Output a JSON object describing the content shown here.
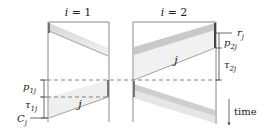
{
  "machines": [
    {
      "label": "i = 1"
    },
    {
      "label": "i = 2"
    }
  ],
  "job_labels": {
    "job_machine1": "j",
    "job_machine2": "j"
  },
  "annotations": {
    "r": "r",
    "r_sub": "j",
    "p2": "p",
    "p2_sub": "2j",
    "tau2": "τ",
    "tau2_sub": "2j",
    "p1": "p",
    "p1_sub": "1j",
    "tau1": "τ",
    "tau1_sub": "1j",
    "C": "C",
    "C_sub": "j",
    "time": "time"
  },
  "colors": {
    "frame": "#8a8a8a",
    "band_light": "#ededed",
    "band_dark": "#c9c9c9",
    "dash": "#666666",
    "text": "#222222"
  }
}
